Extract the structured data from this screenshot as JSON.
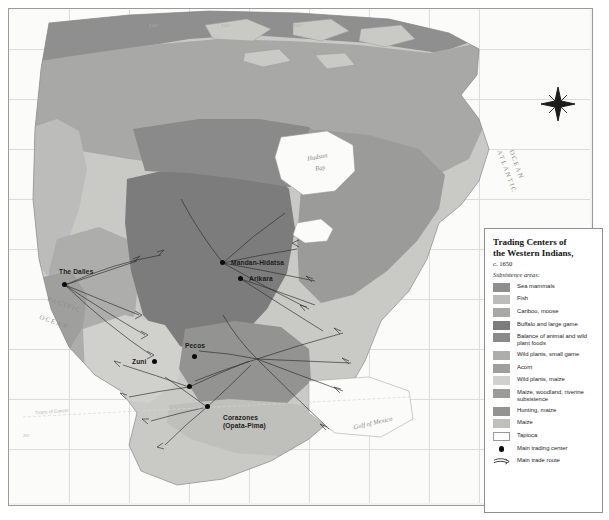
{
  "map": {
    "labels": {
      "atlantic": "ATLANTIC",
      "atlantic2": "OCEAN",
      "pacific": "PACIFIC",
      "pacific2": "OCEAN",
      "hudson_bay": "Hudson",
      "hudson_bay2": "Bay",
      "gulf_of_mexico": "Gulf of Mexico",
      "tropic_of_cancer": "Tropic of Cancer"
    },
    "centers": [
      {
        "name": "The Dalles"
      },
      {
        "name": "Mandan-Hidatsa"
      },
      {
        "name": "Arikara"
      },
      {
        "name": "Zuni"
      },
      {
        "name": "Pecos"
      },
      {
        "name": "Corazones",
        "subname": "(Opata-Pima)"
      }
    ],
    "degree_labels_top": [
      "140°",
      "120°",
      "100°"
    ],
    "degree_labels_left": [
      "20°"
    ]
  },
  "legend": {
    "title_line1": "Trading Centers of",
    "title_line2": "the Western Indians,",
    "date": "c. 1650",
    "subheading": "Subsistence areas:",
    "items": [
      {
        "label": "Sea mammals",
        "color": "#8f8f8f",
        "type": "swatch"
      },
      {
        "label": "Fish",
        "color": "#bcbcba",
        "type": "swatch"
      },
      {
        "label": "Caribou, moose",
        "color": "#a8a8a6",
        "type": "swatch"
      },
      {
        "label": "Buffalo and large game",
        "color": "#7c7c7c",
        "type": "swatch"
      },
      {
        "label": "Balance of animal and wild plant foods",
        "color": "#8a8a8a",
        "type": "swatch"
      },
      {
        "label": "Wild plants, small game",
        "color": "#adadab",
        "type": "swatch"
      },
      {
        "label": "Acorn",
        "color": "#9f9f9d",
        "type": "swatch"
      },
      {
        "label": "Wild plants, maize",
        "color": "#d0d0cd",
        "type": "swatch"
      },
      {
        "label": "Maize, woodland, riverine subsistence",
        "color": "#9b9b99",
        "type": "swatch"
      },
      {
        "label": "Hunting, maize",
        "color": "#939391",
        "type": "swatch"
      },
      {
        "label": "Maize",
        "color": "#bfbfbc",
        "type": "swatch"
      },
      {
        "label": "Tapioca",
        "color": "#ffffff",
        "type": "swatch-outline"
      },
      {
        "label": "Main trading center",
        "color": "#0a0a0a",
        "type": "dot"
      },
      {
        "label": "Main trade route",
        "color": "#2b2b2b",
        "type": "arrow"
      }
    ]
  },
  "colors": {
    "ocean": "#fbfbfa",
    "coastline": "#8b8b8b",
    "frame": "#9a9a9a",
    "graticule": "#dcdcdc"
  }
}
